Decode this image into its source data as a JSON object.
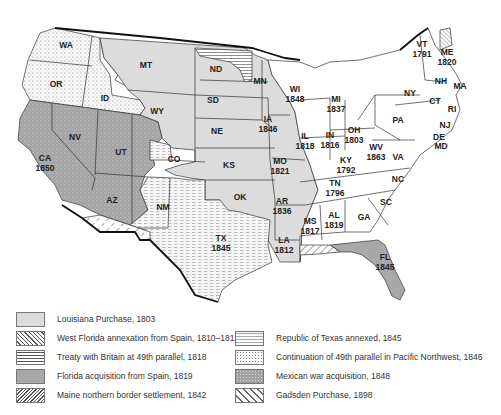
{
  "colors": {
    "louisiana": "#dcdcdc",
    "florida": "#a8a8a8",
    "mexican_war": "#a0a0a0",
    "original": "#ffffff",
    "border": "#111111"
  },
  "states": [
    {
      "abbr": "WA",
      "year": ""
    },
    {
      "abbr": "OR",
      "year": ""
    },
    {
      "abbr": "ID",
      "year": ""
    },
    {
      "abbr": "MT",
      "year": ""
    },
    {
      "abbr": "WY",
      "year": ""
    },
    {
      "abbr": "ND",
      "year": ""
    },
    {
      "abbr": "SD",
      "year": ""
    },
    {
      "abbr": "NE",
      "year": ""
    },
    {
      "abbr": "KS",
      "year": ""
    },
    {
      "abbr": "OK",
      "year": ""
    },
    {
      "abbr": "CO",
      "year": ""
    },
    {
      "abbr": "NM",
      "year": ""
    },
    {
      "abbr": "NV",
      "year": ""
    },
    {
      "abbr": "UT",
      "year": ""
    },
    {
      "abbr": "AZ",
      "year": ""
    },
    {
      "abbr": "CA",
      "year": "1850"
    },
    {
      "abbr": "TX",
      "year": "1845"
    },
    {
      "abbr": "MN",
      "year": ""
    },
    {
      "abbr": "IA",
      "year": "1846"
    },
    {
      "abbr": "MO",
      "year": "1821"
    },
    {
      "abbr": "AR",
      "year": "1836"
    },
    {
      "abbr": "LA",
      "year": "1812"
    },
    {
      "abbr": "WI",
      "year": "1848"
    },
    {
      "abbr": "IL",
      "year": "1818"
    },
    {
      "abbr": "MI",
      "year": "1837"
    },
    {
      "abbr": "IN",
      "year": "1816"
    },
    {
      "abbr": "OH",
      "year": "1803"
    },
    {
      "abbr": "KY",
      "year": "1792"
    },
    {
      "abbr": "TN",
      "year": "1796"
    },
    {
      "abbr": "MS",
      "year": "1817"
    },
    {
      "abbr": "AL",
      "year": "1819"
    },
    {
      "abbr": "WV",
      "year": "1863"
    },
    {
      "abbr": "FL",
      "year": "1845"
    },
    {
      "abbr": "GA",
      "year": ""
    },
    {
      "abbr": "SC",
      "year": ""
    },
    {
      "abbr": "NC",
      "year": ""
    },
    {
      "abbr": "VA",
      "year": ""
    },
    {
      "abbr": "PA",
      "year": ""
    },
    {
      "abbr": "NY",
      "year": ""
    },
    {
      "abbr": "VT",
      "year": "1791"
    },
    {
      "abbr": "ME",
      "year": "1820"
    },
    {
      "abbr": "NH",
      "year": ""
    },
    {
      "abbr": "MA",
      "year": ""
    },
    {
      "abbr": "CT",
      "year": ""
    },
    {
      "abbr": "RI",
      "year": ""
    },
    {
      "abbr": "NJ",
      "year": ""
    },
    {
      "abbr": "DE",
      "year": ""
    },
    {
      "abbr": "MD",
      "year": ""
    }
  ],
  "legend": [
    {
      "label": "Louisiana Purchase, 1803",
      "pattern": "solid-light"
    },
    {
      "label": "West Florida annexation from Spain, 1810–1813",
      "pattern": "diagonal-hatch"
    },
    {
      "label": "Treaty with Britain at 49th parallel, 1818",
      "pattern": "horizontal-lines"
    },
    {
      "label": "Florida acquisition from Spain, 1819",
      "pattern": "solid-dark"
    },
    {
      "label": "Maine northern border settlement, 1842",
      "pattern": "dense-diagonal"
    },
    {
      "label": "Republic of Texas annexed, 1845",
      "pattern": "dashed-lines"
    },
    {
      "label": "Continuation of 49th parallel in Pacific Northwest, 1846",
      "pattern": "dots"
    },
    {
      "label": "Mexican war acquisition, 1848",
      "pattern": "dark-dots"
    },
    {
      "label": "Gadsden Purchase, 1898",
      "pattern": "sparse-diagonal"
    }
  ]
}
